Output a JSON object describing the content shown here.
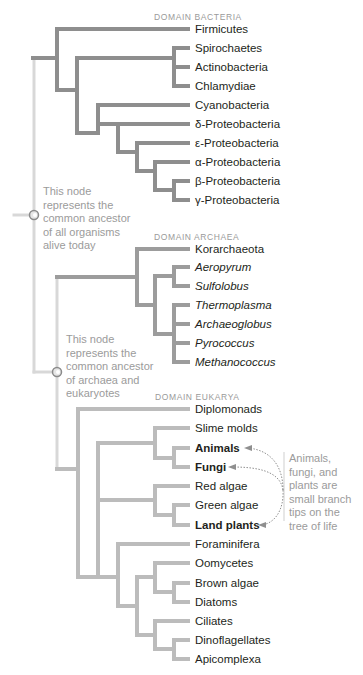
{
  "colors": {
    "bacteria_branch": "#8e8e8e",
    "archaea_branch": "#9c9c9c",
    "eukarya_branch": "#bcbcbc",
    "root_line": "#d8d8d8",
    "text": "#231f20",
    "note_text": "#9b9b9b",
    "domain_label": "#9a9a9a"
  },
  "domains": {
    "bacteria": {
      "label": "DOMAIN BACTERIA",
      "x": 154,
      "y": 12
    },
    "archaea": {
      "label": "DOMAIN ARCHAEA",
      "x": 154,
      "y": 232
    },
    "eukarya": {
      "label": "DOMAIN EUKARYA",
      "x": 155,
      "y": 392
    }
  },
  "notes": {
    "root": {
      "text": "This node\nrepresents the\ncommon ancestor\nof all organisms\nalive today",
      "x": 43,
      "y": 185
    },
    "archaea_eukarya": {
      "text": "This node\nrepresents the\ncommon ancestor\nof archaea and\neukaryotes",
      "x": 66,
      "y": 333
    },
    "callout": {
      "text": "Animals,\nfungi, and\nplants are\nsmall branch\ntips on the\ntree of life",
      "x": 289,
      "y": 452
    }
  },
  "taxa": [
    {
      "name": "Firmicutes",
      "y": 29,
      "style": "normal",
      "domain": "bacteria"
    },
    {
      "name": "Spirochaetes",
      "y": 48,
      "style": "normal",
      "domain": "bacteria"
    },
    {
      "name": "Actinobacteria",
      "y": 67,
      "style": "normal",
      "domain": "bacteria"
    },
    {
      "name": "Chlamydiae",
      "y": 86,
      "style": "normal",
      "domain": "bacteria"
    },
    {
      "name": "Cyanobacteria",
      "y": 105,
      "style": "normal",
      "domain": "bacteria"
    },
    {
      "name": "δ-Proteobacteria",
      "y": 124,
      "style": "normal",
      "domain": "bacteria"
    },
    {
      "name": "ε-Proteobacteria",
      "y": 143,
      "style": "normal",
      "domain": "bacteria"
    },
    {
      "name": "α-Proteobacteria",
      "y": 162,
      "style": "normal",
      "domain": "bacteria"
    },
    {
      "name": "β-Proteobacteria",
      "y": 181,
      "style": "normal",
      "domain": "bacteria"
    },
    {
      "name": "γ-Proteobacteria",
      "y": 200,
      "style": "normal",
      "domain": "bacteria"
    },
    {
      "name": "Korarchaeota",
      "y": 249,
      "style": "normal",
      "domain": "archaea"
    },
    {
      "name": "Aeropyrum",
      "y": 267,
      "style": "italic",
      "domain": "archaea"
    },
    {
      "name": "Sulfolobus",
      "y": 286,
      "style": "italic",
      "domain": "archaea"
    },
    {
      "name": "Thermoplasma",
      "y": 305,
      "style": "italic",
      "domain": "archaea"
    },
    {
      "name": "Archaeoglobus",
      "y": 324,
      "style": "italic",
      "domain": "archaea"
    },
    {
      "name": "Pyrococcus",
      "y": 343,
      "style": "italic",
      "domain": "archaea"
    },
    {
      "name": "Methanococcus",
      "y": 362,
      "style": "italic",
      "domain": "archaea"
    },
    {
      "name": "Diplomonads",
      "y": 409,
      "style": "normal",
      "domain": "eukarya"
    },
    {
      "name": "Slime molds",
      "y": 428,
      "style": "normal",
      "domain": "eukarya"
    },
    {
      "name": "Animals",
      "y": 448,
      "style": "bold",
      "domain": "eukarya"
    },
    {
      "name": "Fungi",
      "y": 467,
      "style": "bold",
      "domain": "eukarya"
    },
    {
      "name": "Red algae",
      "y": 486,
      "style": "normal",
      "domain": "eukarya"
    },
    {
      "name": "Green algae",
      "y": 505,
      "style": "normal",
      "domain": "eukarya"
    },
    {
      "name": "Land plants",
      "y": 525,
      "style": "bold",
      "domain": "eukarya"
    },
    {
      "name": "Foraminifera",
      "y": 544,
      "style": "normal",
      "domain": "eukarya"
    },
    {
      "name": "Oomycetes",
      "y": 563,
      "style": "normal",
      "domain": "eukarya"
    },
    {
      "name": "Brown algae",
      "y": 583,
      "style": "normal",
      "domain": "eukarya"
    },
    {
      "name": "Diatoms",
      "y": 602,
      "style": "normal",
      "domain": "eukarya"
    },
    {
      "name": "Ciliates",
      "y": 621,
      "style": "normal",
      "domain": "eukarya"
    },
    {
      "name": "Dinoflagellates",
      "y": 640,
      "style": "normal",
      "domain": "eukarya"
    },
    {
      "name": "Apicomplexa",
      "y": 659,
      "style": "normal",
      "domain": "eukarya"
    }
  ],
  "label_x": 195,
  "tip_x": 188,
  "branches": {
    "bacteria": [
      [
        33,
        58,
        57,
        58
      ],
      [
        57,
        29,
        57,
        90
      ],
      [
        57,
        29,
        188,
        29
      ],
      [
        57,
        90,
        77,
        90
      ],
      [
        77,
        58,
        77,
        133
      ],
      [
        77,
        58,
        174,
        58
      ],
      [
        174,
        48,
        174,
        86
      ],
      [
        174,
        48,
        188,
        48
      ],
      [
        174,
        67,
        188,
        67
      ],
      [
        174,
        86,
        188,
        86
      ],
      [
        77,
        133,
        98,
        133
      ],
      [
        98,
        105,
        98,
        133
      ],
      [
        98,
        105,
        188,
        105
      ],
      [
        98,
        124,
        118,
        124
      ],
      [
        118,
        124,
        118,
        152
      ],
      [
        118,
        124,
        188,
        124
      ],
      [
        118,
        152,
        137,
        152
      ],
      [
        137,
        143,
        137,
        171
      ],
      [
        137,
        143,
        188,
        143
      ],
      [
        137,
        171,
        155,
        171
      ],
      [
        155,
        162,
        155,
        190
      ],
      [
        155,
        162,
        188,
        162
      ],
      [
        155,
        190,
        174,
        190
      ],
      [
        174,
        181,
        174,
        200
      ],
      [
        174,
        181,
        188,
        181
      ],
      [
        174,
        200,
        188,
        200
      ]
    ],
    "archaea": [
      [
        57,
        277,
        137,
        277
      ],
      [
        137,
        249,
        137,
        305
      ],
      [
        137,
        249,
        188,
        249
      ],
      [
        137,
        305,
        155,
        305
      ],
      [
        155,
        276,
        155,
        334
      ],
      [
        155,
        276,
        174,
        276
      ],
      [
        174,
        267,
        174,
        286
      ],
      [
        174,
        267,
        188,
        267
      ],
      [
        174,
        286,
        188,
        286
      ],
      [
        155,
        334,
        174,
        334
      ],
      [
        174,
        305,
        174,
        362
      ],
      [
        174,
        305,
        188,
        305
      ],
      [
        174,
        324,
        188,
        324
      ],
      [
        174,
        343,
        188,
        343
      ],
      [
        174,
        362,
        188,
        362
      ]
    ],
    "eukarya": [
      [
        57,
        469,
        78,
        469
      ],
      [
        78,
        409,
        78,
        577
      ],
      [
        78,
        409,
        188,
        409
      ],
      [
        78,
        577,
        98,
        577
      ],
      [
        98,
        443,
        98,
        577
      ],
      [
        98,
        443,
        155,
        443
      ],
      [
        155,
        428,
        155,
        458
      ],
      [
        155,
        428,
        188,
        428
      ],
      [
        155,
        458,
        174,
        458
      ],
      [
        174,
        448,
        174,
        467
      ],
      [
        174,
        448,
        188,
        448
      ],
      [
        174,
        467,
        188,
        467
      ],
      [
        98,
        500,
        155,
        500
      ],
      [
        155,
        486,
        155,
        515
      ],
      [
        155,
        486,
        188,
        486
      ],
      [
        155,
        515,
        174,
        515
      ],
      [
        174,
        505,
        174,
        525
      ],
      [
        174,
        505,
        188,
        505
      ],
      [
        174,
        525,
        188,
        525
      ],
      [
        98,
        577,
        118,
        577
      ],
      [
        118,
        544,
        118,
        606
      ],
      [
        118,
        544,
        188,
        544
      ],
      [
        118,
        606,
        137,
        606
      ],
      [
        137,
        577,
        137,
        635
      ],
      [
        137,
        577,
        155,
        577
      ],
      [
        155,
        563,
        155,
        592
      ],
      [
        155,
        563,
        188,
        563
      ],
      [
        155,
        592,
        174,
        592
      ],
      [
        174,
        583,
        174,
        602
      ],
      [
        174,
        583,
        188,
        583
      ],
      [
        174,
        602,
        188,
        602
      ],
      [
        137,
        635,
        155,
        635
      ],
      [
        155,
        621,
        155,
        649
      ],
      [
        155,
        621,
        188,
        621
      ],
      [
        155,
        649,
        174,
        649
      ],
      [
        174,
        640,
        174,
        659
      ],
      [
        174,
        640,
        188,
        640
      ],
      [
        174,
        659,
        188,
        659
      ]
    ],
    "root": [
      [
        34,
        58,
        34,
        215
      ],
      [
        14,
        215,
        30,
        215
      ],
      [
        34,
        215,
        34,
        372
      ],
      [
        34,
        372,
        53,
        372
      ],
      [
        57,
        277,
        57,
        372
      ],
      [
        57,
        372,
        57,
        469
      ]
    ]
  },
  "nodes": [
    {
      "name": "root-ancestor-node",
      "x": 34,
      "y": 215
    },
    {
      "name": "archaea-eukarya-ancestor-node",
      "x": 57,
      "y": 372
    }
  ],
  "arrows": [
    {
      "target": "Animals",
      "path": "M283,490 C283,465 270,450 248,448",
      "tip": [
        244,
        448
      ]
    },
    {
      "target": "Fungi",
      "path": "M283,490 C280,470 255,467 232,467",
      "tip": [
        228,
        467
      ]
    },
    {
      "target": "Land plants",
      "path": "M283,490 C284,510 275,523 262,525",
      "tip": [
        258,
        525
      ]
    }
  ],
  "divider": {
    "x": 284,
    "y1": 452,
    "y2": 521
  }
}
